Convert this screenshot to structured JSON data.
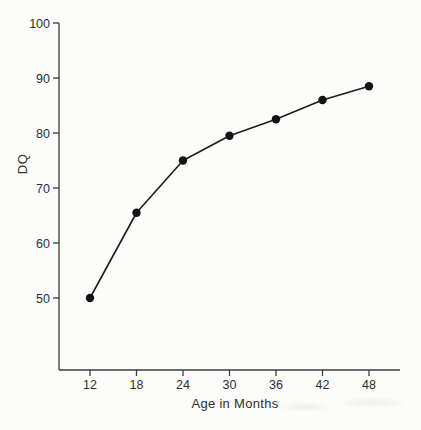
{
  "figure": {
    "background": "#fcfcfa"
  },
  "chart_data": {
    "type": "line",
    "title": "",
    "xlabel": "Age in Months",
    "ylabel": "DQ",
    "x": [
      12,
      18,
      24,
      30,
      36,
      42,
      48
    ],
    "values": [
      50,
      65.5,
      75,
      79.5,
      82.5,
      86,
      88.5
    ],
    "series_name": "DQ",
    "x_ticks": [
      "12",
      "18",
      "24",
      "30",
      "36",
      "42",
      "48"
    ],
    "y_ticks": [
      "50",
      "60",
      "70",
      "80",
      "90",
      "100"
    ],
    "xlim": [
      8.2,
      52
    ],
    "ylim": [
      37,
      100
    ],
    "grid": false,
    "legend_position": "none",
    "marker": "filled-circle",
    "colors": {
      "line": "#1c1c1c",
      "marker": "#141414",
      "axis": "#3c3c3c",
      "tick_text": "#2e2e2e",
      "background": "#fcfcfa"
    }
  }
}
